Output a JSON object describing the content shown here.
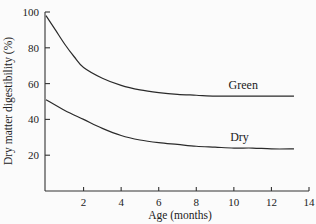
{
  "chart_data": {
    "type": "line",
    "title": "",
    "xlabel": "Age (months)",
    "ylabel": "Dry matter digestibility (%)",
    "xlim": [
      0,
      14
    ],
    "ylim": [
      0,
      100
    ],
    "xticks": [
      2,
      4,
      6,
      8,
      10,
      12,
      14
    ],
    "yticks": [
      20,
      40,
      60,
      80,
      100
    ],
    "grid": false,
    "legend": "inline labels",
    "series": [
      {
        "name": "Green",
        "x": [
          0,
          0.5,
          1,
          1.5,
          2,
          3,
          4,
          5,
          6,
          7,
          8,
          9,
          10,
          11,
          12,
          13.2
        ],
        "values": [
          98,
          90,
          82,
          75,
          69,
          63,
          59,
          56.5,
          55,
          54,
          53.5,
          53,
          53,
          53,
          53,
          53
        ]
      },
      {
        "name": "Dry",
        "x": [
          0,
          1,
          2,
          3,
          4,
          5,
          6,
          7,
          8,
          9,
          10,
          11,
          12,
          13.2
        ],
        "values": [
          51,
          45,
          40,
          35,
          31,
          28.5,
          27,
          26,
          25,
          24.5,
          24,
          24,
          23.5,
          23.5
        ]
      }
    ],
    "annotations": [
      {
        "text": "Green",
        "x": 10.5,
        "y": 57
      },
      {
        "text": "Dry",
        "x": 10.3,
        "y": 28
      }
    ]
  }
}
